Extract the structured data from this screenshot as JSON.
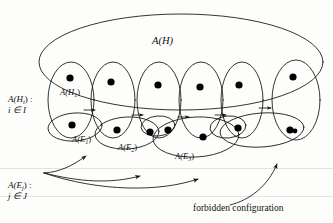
{
  "figure": {
    "type": "set-diagram",
    "labels": {
      "outer_set": "A(H)",
      "first_vertex_set": "A(H",
      "first_vertex_set_sub": "1",
      "edge1": "A(E",
      "edge1_sub": "1",
      "edge2": "A(E",
      "edge2_sub": "2",
      "edge3": "A(E",
      "edge3_sub": "3",
      "family_h_name": "A(H",
      "family_h_sub": "i",
      "family_h_tail": ") :",
      "family_h_index": "i ∈ I",
      "family_e_name": "A(E",
      "family_e_sub": "j",
      "family_e_tail": ") :",
      "family_e_index": "j ∈ J",
      "caption": "forbidden configuration"
    },
    "colors": {
      "ink": "#111111",
      "paper": "#fdfdfb",
      "dot": "#000000"
    },
    "counts": {
      "vertical_ellipses": 6,
      "dots": 15,
      "inner_arrows": 5,
      "annotation_arrows": 4
    }
  }
}
